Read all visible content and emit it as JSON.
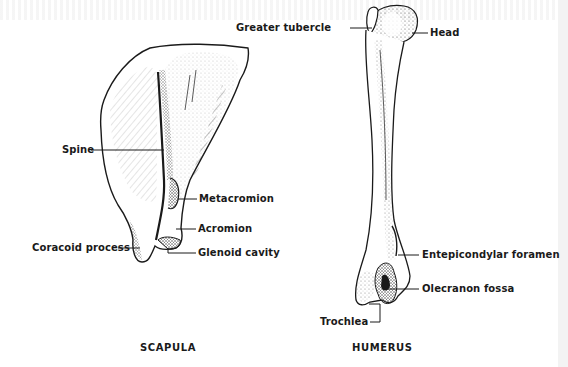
{
  "figure": {
    "scapula": {
      "caption": "SCAPULA",
      "labels": {
        "spine": "Spine",
        "metacromion": "Metacromion",
        "acromion": "Acromion",
        "coracoid_process": "Coracoid process",
        "glenoid_cavity": "Glenoid cavity"
      }
    },
    "humerus": {
      "caption": "HUMERUS",
      "labels": {
        "greater_tubercle": "Greater tubercle",
        "head": "Head",
        "entepicondylar_foramen": "Entepicondylar foramen",
        "olecranon_fossa": "Olecranon fossa",
        "trochlea": "Trochlea"
      }
    },
    "colors": {
      "ink": "#1a1a1a",
      "stipple": "#555555",
      "background": "#ffffff"
    }
  }
}
